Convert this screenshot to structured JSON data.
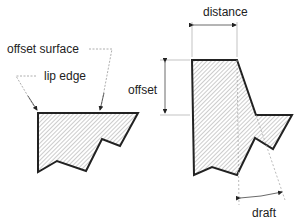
{
  "diagram": {
    "left_figure": {
      "labels": {
        "offset_surface": "offset surface",
        "lip_edge": "lip edge"
      }
    },
    "right_figure": {
      "labels": {
        "distance": "distance",
        "offset": "offset",
        "draft": "draft"
      }
    },
    "colors": {
      "outline": "#222222",
      "hatch": "#9a9a9a",
      "leader": "#888888",
      "text": "#222222"
    }
  }
}
